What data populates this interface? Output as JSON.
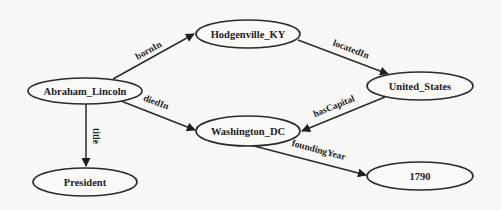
{
  "diagram": {
    "type": "knowledge-graph",
    "nodes": [
      {
        "id": "abraham_lincoln",
        "label": "Abraham_Lincoln",
        "cx": 85,
        "cy": 91,
        "rx": 57,
        "ry": 13
      },
      {
        "id": "hodgenville_ky",
        "label": "Hodgenville_KY",
        "cx": 248,
        "cy": 34,
        "rx": 52,
        "ry": 14
      },
      {
        "id": "united_states",
        "label": "United_States",
        "cx": 420,
        "cy": 86,
        "rx": 53,
        "ry": 14
      },
      {
        "id": "washington_dc",
        "label": "Washington_DC",
        "cx": 248,
        "cy": 131,
        "rx": 52,
        "ry": 15
      },
      {
        "id": "president",
        "label": "President",
        "cx": 85,
        "cy": 182,
        "rx": 52,
        "ry": 14
      },
      {
        "id": "year_1790",
        "label": "1790",
        "cx": 420,
        "cy": 176,
        "rx": 53,
        "ry": 14
      }
    ],
    "edges": [
      {
        "id": "bornIn",
        "label": "bornIn",
        "from": "abraham_lincoln",
        "to": "hodgenville_ky",
        "x1": 113,
        "y1": 79,
        "x2": 194,
        "y2": 34,
        "lx": 150,
        "ly": 53,
        "angle": -29
      },
      {
        "id": "locatedIn",
        "label": "locatedIn",
        "from": "hodgenville_ky",
        "to": "united_states",
        "x1": 298,
        "y1": 40,
        "x2": 388,
        "y2": 74,
        "lx": 350,
        "ly": 52,
        "angle": 21
      },
      {
        "id": "hasCapital",
        "label": "hasCapital",
        "from": "united_states",
        "to": "washington_dc",
        "x1": 385,
        "y1": 97,
        "x2": 302,
        "y2": 131,
        "lx": 335,
        "ly": 109,
        "angle": -22
      },
      {
        "id": "diedIn",
        "label": "diedIn",
        "from": "abraham_lincoln",
        "to": "washington_dc",
        "x1": 121,
        "y1": 101,
        "x2": 195,
        "y2": 130,
        "lx": 155,
        "ly": 105,
        "angle": 21
      },
      {
        "id": "title",
        "label": "title",
        "from": "abraham_lincoln",
        "to": "president",
        "x1": 86,
        "y1": 104,
        "x2": 86,
        "y2": 166,
        "lx": 93,
        "ly": 136,
        "angle": 90
      },
      {
        "id": "foundingYear",
        "label": "foundingYear",
        "from": "washington_dc",
        "to": "year_1790",
        "x1": 254,
        "y1": 146,
        "x2": 366,
        "y2": 175,
        "lx": 318,
        "ly": 153,
        "angle": 15
      }
    ]
  }
}
